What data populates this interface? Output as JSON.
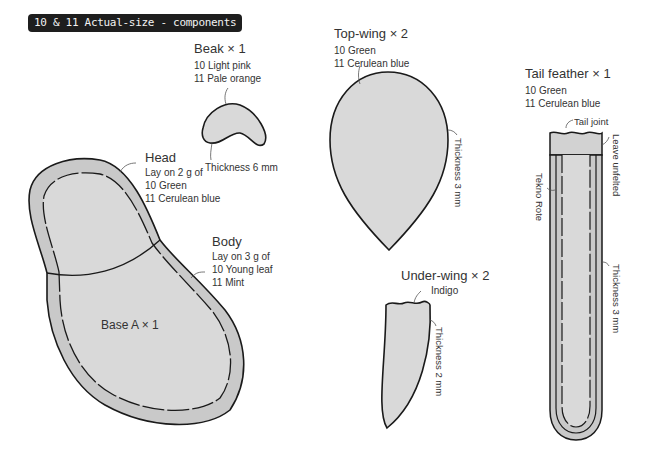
{
  "title": "10 & 11 Actual-size - components",
  "colors": {
    "fill": "#d9d9d9",
    "band": "#c9c9c9",
    "stroke": "#1a1a1a",
    "badge_bg": "#1e1e1e"
  },
  "components": {
    "beak": {
      "name": "Beak × 1",
      "c10": "10 Light pink",
      "c11": "11 Pale orange",
      "thickness": "Thickness 6 mm"
    },
    "head": {
      "name": "Head",
      "lay": "Lay on 2 g of",
      "c10": "10 Green",
      "c11": "11 Cerulean blue"
    },
    "body": {
      "name": "Body",
      "lay": "Lay on 3 g of",
      "c10": "10 Young leaf",
      "c11": "11 Mint"
    },
    "base": {
      "name": "Base A × 1"
    },
    "topwing": {
      "name": "Top-wing × 2",
      "c10": "10 Green",
      "c11": "11 Cerulean blue",
      "thickness": "Thickness 3 mm"
    },
    "underwing": {
      "name": "Under-wing × 2",
      "color": "Indigo",
      "thickness": "Thickness 2 mm"
    },
    "tail": {
      "name": "Tail feather × 1",
      "c10": "10 Green",
      "c11": "11 Cerulean blue",
      "joint": "Tail joint",
      "unfelted": "Leave unfelted",
      "rope": "Tekno Rote",
      "thickness": "Thickness 3 mm"
    }
  }
}
